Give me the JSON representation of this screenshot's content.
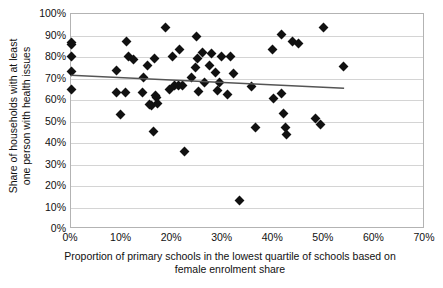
{
  "chart_data": {
    "type": "scatter",
    "title": "",
    "xlabel": "Proportion of primary schools in the lowest quartile of schools based on female enrolment share",
    "xlabel_lines": [
      "Proportion of primary schools in the lowest quartile of schools based on",
      "female enrolment share"
    ],
    "ylabel": "Share of households with at least one person with health issues",
    "ylabel_lines": [
      "Share of households with at least",
      "one person with health issues"
    ],
    "xlim": [
      0,
      70
    ],
    "ylim": [
      0,
      100
    ],
    "xticks": [
      "0%",
      "10%",
      "20%",
      "30%",
      "40%",
      "50%",
      "60%",
      "70%"
    ],
    "xtick_values": [
      0,
      10,
      20,
      30,
      40,
      50,
      60,
      70
    ],
    "yticks": [
      "0%",
      "10%",
      "20%",
      "30%",
      "40%",
      "50%",
      "60%",
      "70%",
      "80%",
      "90%",
      "100%"
    ],
    "ytick_values": [
      0,
      10,
      20,
      30,
      40,
      50,
      60,
      70,
      80,
      90,
      100
    ],
    "grid": "horizontal",
    "legend": "none",
    "marker": "diamond",
    "marker_color": "#111111",
    "gridline_color": "#d4d4d4",
    "axis_color": "#b3b3b3",
    "trendline": {
      "type": "linear",
      "color": "#555555",
      "x_start": 0.0,
      "y_start": 71.5,
      "x_end": 54.0,
      "y_end": 65.5
    },
    "points": [
      {
        "x": 0.0,
        "y": 86.6
      },
      {
        "x": 0.0,
        "y": 85.6
      },
      {
        "x": 0.0,
        "y": 80.2
      },
      {
        "x": 0.0,
        "y": 73.2
      },
      {
        "x": 0.0,
        "y": 65.1
      },
      {
        "x": 8.9,
        "y": 73.8
      },
      {
        "x": 9.0,
        "y": 63.5
      },
      {
        "x": 9.8,
        "y": 53.3
      },
      {
        "x": 10.7,
        "y": 63.5
      },
      {
        "x": 11.0,
        "y": 87.0
      },
      {
        "x": 11.3,
        "y": 80.1
      },
      {
        "x": 12.4,
        "y": 79.0
      },
      {
        "x": 14.2,
        "y": 63.7
      },
      {
        "x": 14.4,
        "y": 70.3
      },
      {
        "x": 15.2,
        "y": 75.9
      },
      {
        "x": 15.5,
        "y": 57.8
      },
      {
        "x": 15.9,
        "y": 57.6
      },
      {
        "x": 16.3,
        "y": 45.5
      },
      {
        "x": 16.6,
        "y": 79.3
      },
      {
        "x": 16.8,
        "y": 62.0
      },
      {
        "x": 16.9,
        "y": 61.3
      },
      {
        "x": 17.2,
        "y": 58.3
      },
      {
        "x": 18.6,
        "y": 93.5
      },
      {
        "x": 19.4,
        "y": 64.9
      },
      {
        "x": 20.0,
        "y": 80.2
      },
      {
        "x": 20.5,
        "y": 66.9
      },
      {
        "x": 21.2,
        "y": 66.8
      },
      {
        "x": 21.4,
        "y": 83.7
      },
      {
        "x": 22.0,
        "y": 66.7
      },
      {
        "x": 22.4,
        "y": 35.9
      },
      {
        "x": 23.9,
        "y": 70.6
      },
      {
        "x": 24.7,
        "y": 75.2
      },
      {
        "x": 24.9,
        "y": 89.6
      },
      {
        "x": 25.0,
        "y": 79.1
      },
      {
        "x": 25.2,
        "y": 64.0
      },
      {
        "x": 26.0,
        "y": 81.9
      },
      {
        "x": 26.4,
        "y": 68.3
      },
      {
        "x": 27.3,
        "y": 75.9
      },
      {
        "x": 27.7,
        "y": 81.4
      },
      {
        "x": 28.6,
        "y": 72.8
      },
      {
        "x": 29.0,
        "y": 64.5
      },
      {
        "x": 29.4,
        "y": 68.3
      },
      {
        "x": 29.8,
        "y": 80.2
      },
      {
        "x": 31.0,
        "y": 62.7
      },
      {
        "x": 31.5,
        "y": 80.4
      },
      {
        "x": 32.2,
        "y": 72.3
      },
      {
        "x": 33.4,
        "y": 13.4
      },
      {
        "x": 35.6,
        "y": 66.3
      },
      {
        "x": 36.4,
        "y": 47.0
      },
      {
        "x": 39.8,
        "y": 83.4
      },
      {
        "x": 40.0,
        "y": 60.5
      },
      {
        "x": 41.6,
        "y": 90.4
      },
      {
        "x": 41.7,
        "y": 62.9
      },
      {
        "x": 42.0,
        "y": 53.8
      },
      {
        "x": 42.4,
        "y": 47.2
      },
      {
        "x": 42.6,
        "y": 44.0
      },
      {
        "x": 43.8,
        "y": 87.0
      },
      {
        "x": 45.0,
        "y": 86.1
      },
      {
        "x": 48.4,
        "y": 51.5
      },
      {
        "x": 49.3,
        "y": 48.7
      },
      {
        "x": 50.0,
        "y": 93.8
      },
      {
        "x": 53.8,
        "y": 75.8
      }
    ]
  }
}
